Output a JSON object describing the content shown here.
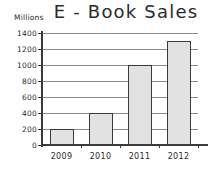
{
  "chart_data": {
    "type": "bar",
    "title": "E - Book Sales",
    "xlabel": "",
    "ylabel": "Millions",
    "categories": [
      "2009",
      "2010",
      "2011",
      "2012"
    ],
    "values": [
      200,
      400,
      1000,
      1300
    ],
    "ylim": [
      0,
      1400
    ],
    "ytick_step": 200,
    "yticks": [
      "1400",
      "1200",
      "1000",
      "800",
      "600",
      "400",
      "200",
      "0"
    ],
    "ytick_values": [
      1400,
      1200,
      1000,
      800,
      600,
      400,
      200,
      0
    ],
    "grid": true,
    "legend": false,
    "bar_fill_color": "#e2e2e2",
    "bar_border_color": "#3a3a3a",
    "axis_color": "#3a3a3a",
    "gridline_color": "#8d8d8d",
    "background_color": "#ffffff"
  }
}
